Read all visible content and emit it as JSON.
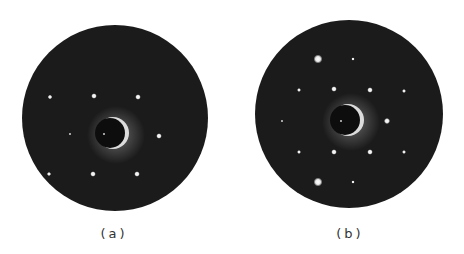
{
  "figure": {
    "panels": [
      {
        "label": "(a)",
        "circle": {
          "cx": 115,
          "cy": 118,
          "r": 93
        },
        "shadow": {
          "cx": 110,
          "cy": 133,
          "r": 15
        },
        "spots": [
          {
            "x": 50,
            "y": 97,
            "r": 1.6
          },
          {
            "x": 94,
            "y": 96,
            "r": 2
          },
          {
            "x": 138,
            "y": 97,
            "r": 2
          },
          {
            "x": 70,
            "y": 134,
            "r": 0.8
          },
          {
            "x": 104,
            "y": 134,
            "r": 0.8
          },
          {
            "x": 159,
            "y": 136,
            "r": 2
          },
          {
            "x": 49,
            "y": 174,
            "r": 1.5
          },
          {
            "x": 93,
            "y": 174,
            "r": 2
          },
          {
            "x": 137,
            "y": 174,
            "r": 2
          }
        ],
        "label_pos": {
          "x": 114,
          "y": 226
        }
      },
      {
        "label": "(b)",
        "circle": {
          "cx": 349,
          "cy": 114,
          "r": 94
        },
        "shadow": {
          "cx": 345,
          "cy": 120,
          "r": 15
        },
        "spots": [
          {
            "x": 318,
            "y": 59,
            "r": 3.2
          },
          {
            "x": 353,
            "y": 59,
            "r": 1.2
          },
          {
            "x": 299,
            "y": 90,
            "r": 1.4
          },
          {
            "x": 334,
            "y": 89,
            "r": 2
          },
          {
            "x": 370,
            "y": 90,
            "r": 2
          },
          {
            "x": 404,
            "y": 91,
            "r": 1.4
          },
          {
            "x": 282,
            "y": 121,
            "r": 0.8
          },
          {
            "x": 341,
            "y": 121,
            "r": 0.8
          },
          {
            "x": 387,
            "y": 121,
            "r": 2.2
          },
          {
            "x": 299,
            "y": 152,
            "r": 1.4
          },
          {
            "x": 334,
            "y": 152,
            "r": 2
          },
          {
            "x": 370,
            "y": 152,
            "r": 2
          },
          {
            "x": 404,
            "y": 152,
            "r": 1.4
          },
          {
            "x": 318,
            "y": 182,
            "r": 3.2
          },
          {
            "x": 353,
            "y": 182,
            "r": 1.2
          }
        ],
        "label_pos": {
          "x": 350,
          "y": 226
        }
      }
    ],
    "colors": {
      "disk": "#1b1b1b",
      "spot": "#ffffff",
      "glow": "#dcdcdc",
      "background": "#ffffff"
    }
  }
}
